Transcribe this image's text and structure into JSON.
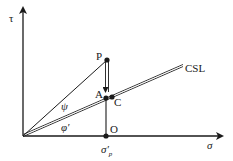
{
  "diagram": {
    "axes": {
      "y_label": "τ",
      "x_label": "σ"
    },
    "points": {
      "P": "P",
      "A": "A",
      "C": "C",
      "O": "O"
    },
    "line_label": "CSL",
    "angles": {
      "psi": "ψ",
      "phi": "φ′"
    },
    "x_marker": {
      "symbol": "σ′",
      "subscript": "p"
    },
    "colors": {
      "ink": "#1a1a1a",
      "background": "#ffffff"
    }
  }
}
